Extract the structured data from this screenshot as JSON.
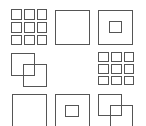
{
  "puzzle": {
    "stroke_color": "#555555",
    "background": "#ffffff",
    "cells": [
      {
        "id": "r1c1",
        "pattern": "grid-3x3-full",
        "shapes": [
          {
            "x": 11,
            "y": 9,
            "w": 11,
            "h": 11
          },
          {
            "x": 24,
            "y": 9,
            "w": 11,
            "h": 11
          },
          {
            "x": 37,
            "y": 9,
            "w": 10,
            "h": 11
          },
          {
            "x": 11,
            "y": 22,
            "w": 11,
            "h": 11
          },
          {
            "x": 24,
            "y": 22,
            "w": 11,
            "h": 11
          },
          {
            "x": 37,
            "y": 22,
            "w": 10,
            "h": 11
          },
          {
            "x": 11,
            "y": 35,
            "w": 11,
            "h": 10
          },
          {
            "x": 24,
            "y": 35,
            "w": 11,
            "h": 10
          },
          {
            "x": 37,
            "y": 35,
            "w": 10,
            "h": 10
          }
        ]
      },
      {
        "id": "r1c2",
        "pattern": "single-square",
        "shapes": [
          {
            "x": 55,
            "y": 10,
            "w": 35,
            "h": 35
          }
        ]
      },
      {
        "id": "r1c3",
        "pattern": "square-with-inner-square",
        "shapes": [
          {
            "x": 98,
            "y": 10,
            "w": 35,
            "h": 35
          },
          {
            "x": 109,
            "y": 21,
            "w": 13,
            "h": 12
          }
        ]
      },
      {
        "id": "r2c1",
        "pattern": "overlapping-squares",
        "shapes": [
          {
            "x": 11,
            "y": 53,
            "w": 24,
            "h": 23
          },
          {
            "x": 23,
            "y": 64,
            "w": 24,
            "h": 23
          }
        ]
      },
      {
        "id": "r2c2",
        "pattern": "empty",
        "shapes": []
      },
      {
        "id": "r2c3",
        "pattern": "grid-3x3-full",
        "shapes": [
          {
            "x": 98,
            "y": 52,
            "w": 11,
            "h": 10
          },
          {
            "x": 111,
            "y": 52,
            "w": 11,
            "h": 10
          },
          {
            "x": 124,
            "y": 52,
            "w": 10,
            "h": 10
          },
          {
            "x": 98,
            "y": 64,
            "w": 11,
            "h": 10
          },
          {
            "x": 111,
            "y": 64,
            "w": 11,
            "h": 10
          },
          {
            "x": 124,
            "y": 64,
            "w": 10,
            "h": 10
          },
          {
            "x": 98,
            "y": 76,
            "w": 11,
            "h": 9
          },
          {
            "x": 111,
            "y": 76,
            "w": 11,
            "h": 9
          },
          {
            "x": 124,
            "y": 76,
            "w": 10,
            "h": 9
          }
        ]
      },
      {
        "id": "r3c1",
        "pattern": "single-square",
        "shapes": [
          {
            "x": 12,
            "y": 94,
            "w": 35,
            "h": 35
          }
        ]
      },
      {
        "id": "r3c2",
        "pattern": "square-with-inner-square",
        "shapes": [
          {
            "x": 55,
            "y": 94,
            "w": 35,
            "h": 35
          },
          {
            "x": 65,
            "y": 105,
            "w": 14,
            "h": 12
          }
        ]
      },
      {
        "id": "r3c3",
        "pattern": "overlapping-squares",
        "shapes": [
          {
            "x": 98,
            "y": 94,
            "w": 24,
            "h": 22
          },
          {
            "x": 110,
            "y": 105,
            "w": 23,
            "h": 23
          }
        ]
      }
    ]
  }
}
